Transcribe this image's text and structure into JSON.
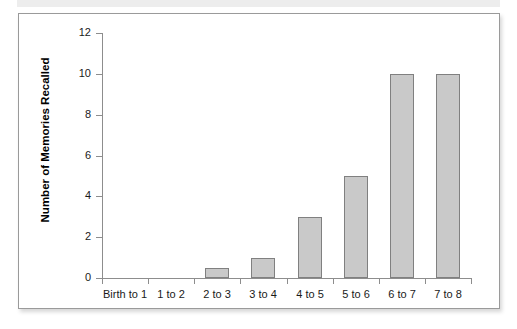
{
  "chart_data": {
    "type": "bar",
    "title": "",
    "subtitle": "",
    "xlabel": "",
    "ylabel": "Number of Memories Recalled",
    "categories": [
      "Birth to 1",
      "1 to 2",
      "2 to 3",
      "3 to 4",
      "4 to 5",
      "5 to 6",
      "6 to 7",
      "7 to 8"
    ],
    "values": [
      0,
      0,
      0.5,
      1,
      3,
      5,
      10,
      10
    ],
    "ylim": [
      0,
      12
    ],
    "y_ticks": [
      0,
      2,
      4,
      6,
      8,
      10,
      12
    ],
    "y_tick_labels": [
      "0",
      "2",
      "4",
      "6",
      "8",
      "10",
      "12"
    ],
    "grid": false,
    "legend": null,
    "legend_position": "none",
    "series": [
      {
        "name": "Number of Memories Recalled",
        "values": [
          0,
          0,
          0.5,
          1,
          3,
          5,
          10,
          10
        ]
      }
    ],
    "annotations": []
  },
  "style": {
    "bar_fill": "#c9c9c9",
    "bar_border": "#808080",
    "axis_color": "#8d8d8d",
    "text_color": "#1a1a1a",
    "frame_border": "#9a9a9a",
    "background": "#ffffff",
    "top_band": "#ededed"
  }
}
